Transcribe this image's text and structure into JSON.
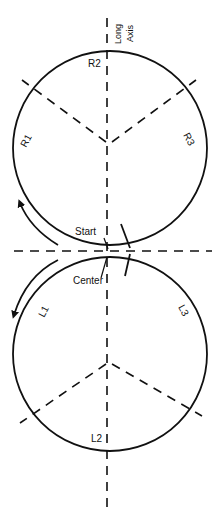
{
  "diagram": {
    "axis_label_line1": "Long",
    "axis_label_line2": "Axis",
    "labels": {
      "r1": "R1",
      "r2": "R2",
      "r3": "R3",
      "l1": "L1",
      "l2": "L2",
      "l3": "L3",
      "start": "Start",
      "center": "Center"
    },
    "colors": {
      "stroke": "#111111",
      "background": "#ffffff"
    }
  }
}
